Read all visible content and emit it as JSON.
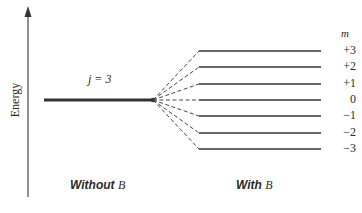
{
  "diagram": {
    "axis_label": "Energy",
    "unsplit_level": {
      "label": "j = 3",
      "j": 3
    },
    "split_levels_header": "m",
    "split_levels": [
      {
        "m": 3,
        "label": "+3"
      },
      {
        "m": 2,
        "label": "+2"
      },
      {
        "m": 1,
        "label": "+1"
      },
      {
        "m": 0,
        "label": "0"
      },
      {
        "m": -1,
        "label": "−1"
      },
      {
        "m": -2,
        "label": "−2"
      },
      {
        "m": -3,
        "label": "−3"
      }
    ],
    "captions": {
      "without": {
        "text": "Without ",
        "symbol": "B"
      },
      "with": {
        "text": "With ",
        "symbol": "B"
      }
    },
    "colors": {
      "line": "#3a3a3a",
      "axis": "#555555",
      "text": "#2a2a2a"
    }
  }
}
